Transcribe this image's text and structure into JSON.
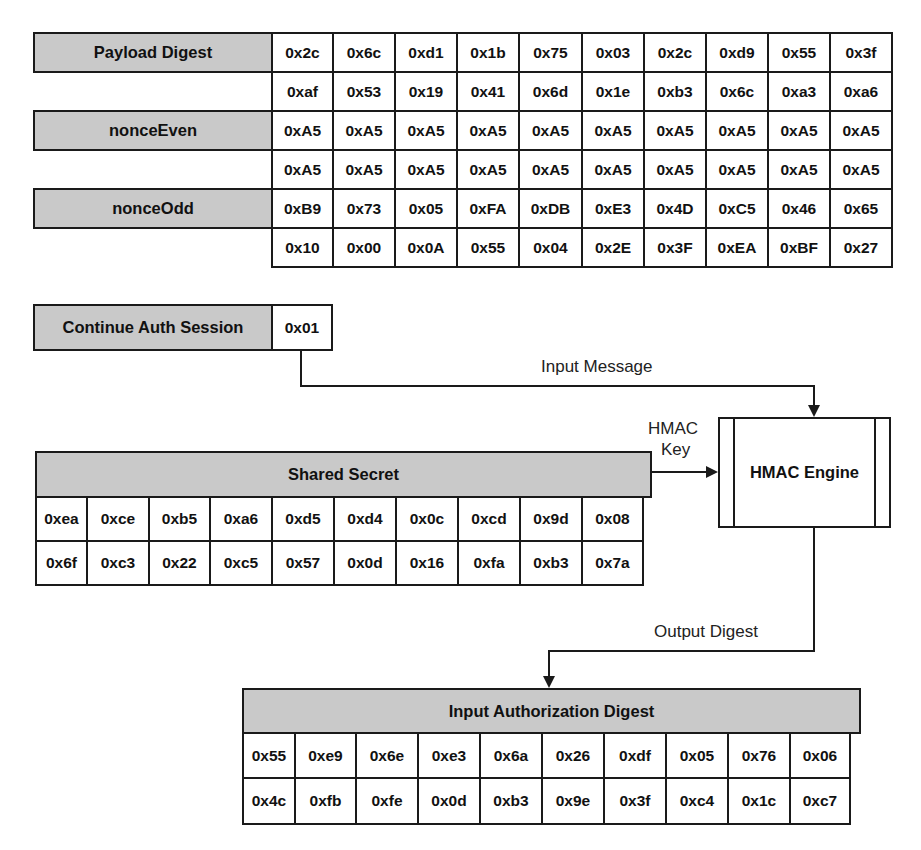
{
  "input_fields": [
    {
      "label": "Payload Digest",
      "rows": [
        [
          "0x2c",
          "0x6c",
          "0xd1",
          "0x1b",
          "0x75",
          "0x03",
          "0x2c",
          "0xd9",
          "0x55",
          "0x3f"
        ],
        [
          "0xaf",
          "0x53",
          "0x19",
          "0x41",
          "0x6d",
          "0x1e",
          "0xb3",
          "0x6c",
          "0xa3",
          "0xa6"
        ]
      ]
    },
    {
      "label": "nonceEven",
      "rows": [
        [
          "0xA5",
          "0xA5",
          "0xA5",
          "0xA5",
          "0xA5",
          "0xA5",
          "0xA5",
          "0xA5",
          "0xA5",
          "0xA5"
        ],
        [
          "0xA5",
          "0xA5",
          "0xA5",
          "0xA5",
          "0xA5",
          "0xA5",
          "0xA5",
          "0xA5",
          "0xA5",
          "0xA5"
        ]
      ]
    },
    {
      "label": "nonceOdd",
      "rows": [
        [
          "0xB9",
          "0x73",
          "0x05",
          "0xFA",
          "0xDB",
          "0xE3",
          "0x4D",
          "0xC5",
          "0x46",
          "0x65"
        ],
        [
          "0x10",
          "0x00",
          "0x0A",
          "0x55",
          "0x04",
          "0x2E",
          "0x3F",
          "0xEA",
          "0xBF",
          "0x27"
        ]
      ]
    },
    {
      "label": "Continue Auth Session",
      "rows": [
        [
          "0x01"
        ]
      ]
    }
  ],
  "shared_secret": {
    "title": "Shared Secret",
    "rows": [
      [
        "0xea",
        "0xce",
        "0xb5",
        "0xa6",
        "0xd5",
        "0xd4",
        "0x0c",
        "0xcd",
        "0x9d",
        "0x08"
      ],
      [
        "0x6f",
        "0xc3",
        "0x22",
        "0xc5",
        "0x57",
        "0x0d",
        "0x16",
        "0xfa",
        "0xb3",
        "0x7a"
      ]
    ]
  },
  "engine": {
    "title": "HMAC Engine"
  },
  "connectors": {
    "input_message": "Input Message",
    "hmac_key_line1": "HMAC",
    "hmac_key_line2": "Key",
    "output_digest": "Output Digest"
  },
  "output": {
    "title": "Input Authorization Digest",
    "rows": [
      [
        "0x55",
        "0xe9",
        "0x6e",
        "0xe3",
        "0x6a",
        "0x26",
        "0xdf",
        "0x05",
        "0x76",
        "0x06"
      ],
      [
        "0x4c",
        "0xfb",
        "0xfe",
        "0x0d",
        "0xb3",
        "0x9e",
        "0x3f",
        "0xc4",
        "0x1c",
        "0xc7"
      ]
    ]
  },
  "colors": {
    "label_fill": "#c9c9c9",
    "line": "#1a1a1a",
    "cell_fill": "#ffffff"
  }
}
